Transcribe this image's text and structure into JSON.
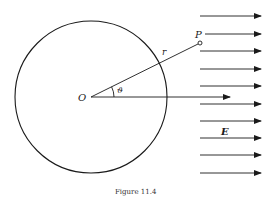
{
  "figure": {
    "caption": "Figure 11.4",
    "labels": {
      "origin": "O",
      "point": "P",
      "radius": "r",
      "angle": "ϑ",
      "field": "E"
    },
    "colors": {
      "ink": "#1a1a1a",
      "background": "#ffffff"
    },
    "circle": {
      "cx": 91,
      "cy": 97,
      "r": 76
    },
    "field_arrows": {
      "count": 10,
      "x_start": 200,
      "x_end": 261,
      "y_positions": [
        16,
        34,
        51,
        69,
        86,
        104,
        121,
        138,
        155,
        173
      ]
    }
  }
}
